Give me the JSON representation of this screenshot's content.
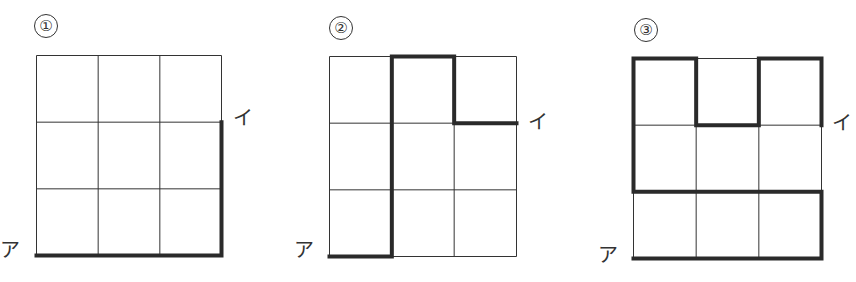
{
  "figure": {
    "panels": [
      {
        "id": 1,
        "number_label": "①",
        "start_label": "ア",
        "end_label": "イ",
        "grid": {
          "cols": 3,
          "rows": 3
        },
        "path": [
          [
            0,
            3
          ],
          [
            3,
            3
          ],
          [
            3,
            1
          ]
        ]
      },
      {
        "id": 2,
        "number_label": "②",
        "start_label": "ア",
        "end_label": "イ",
        "grid": {
          "cols": 3,
          "rows": 3
        },
        "path": [
          [
            0,
            3
          ],
          [
            1,
            3
          ],
          [
            1,
            0
          ],
          [
            2,
            0
          ],
          [
            2,
            1
          ],
          [
            3,
            1
          ]
        ]
      },
      {
        "id": 3,
        "number_label": "③",
        "start_label": "ア",
        "end_label": "イ",
        "grid": {
          "cols": 3,
          "rows": 3
        },
        "path": [
          [
            0,
            3
          ],
          [
            3,
            3
          ],
          [
            3,
            2
          ],
          [
            0,
            2
          ],
          [
            0,
            0
          ],
          [
            1,
            0
          ],
          [
            1,
            1
          ],
          [
            2,
            1
          ],
          [
            2,
            0
          ],
          [
            3,
            0
          ],
          [
            3,
            1
          ]
        ]
      }
    ],
    "colors": {
      "grid_line": "#333333",
      "path_line": "#2a2a2a"
    }
  }
}
